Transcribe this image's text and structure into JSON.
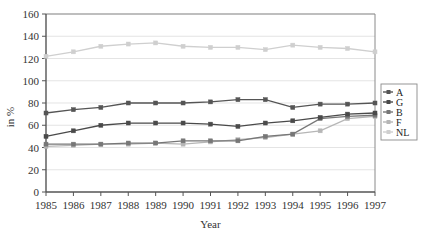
{
  "chart_data": {
    "type": "line",
    "title": "",
    "xlabel": "Year",
    "ylabel": "in %",
    "x": [
      1985,
      1986,
      1987,
      1988,
      1989,
      1990,
      1991,
      1992,
      1993,
      1994,
      1995,
      1996,
      1997
    ],
    "categories": [
      "1985",
      "1986",
      "1987",
      "1988",
      "1989",
      "1990",
      "1991",
      "1992",
      "1993",
      "1994",
      "1995",
      "1996",
      "1997"
    ],
    "ylim": [
      0,
      160
    ],
    "yticks": [
      0,
      20,
      40,
      60,
      80,
      100,
      120,
      140,
      160
    ],
    "ytick_labels": [
      "0",
      "20",
      "40",
      "60",
      "80",
      "100",
      "120",
      "140",
      "160"
    ],
    "grid": true,
    "legend_position": "right",
    "series": [
      {
        "name": "A",
        "color": "#555555",
        "values": [
          71,
          74,
          76,
          80,
          80,
          80,
          81,
          83,
          83,
          76,
          79,
          79,
          80
        ]
      },
      {
        "name": "G",
        "color": "#4a4a4a",
        "values": [
          50,
          55,
          60,
          62,
          62,
          62,
          61,
          59,
          62,
          64,
          67,
          70,
          71
        ]
      },
      {
        "name": "B",
        "color": "#777777",
        "values": [
          43,
          43,
          43,
          44,
          44,
          46,
          46,
          46,
          50,
          52,
          66,
          68,
          69
        ]
      },
      {
        "name": "F",
        "color": "#b6b6b6",
        "values": [
          41,
          42,
          43,
          43,
          44,
          43,
          45,
          47,
          49,
          52,
          55,
          66,
          68
        ]
      },
      {
        "name": "NL",
        "color": "#cfcfcf",
        "values": [
          122,
          126,
          131,
          133,
          134,
          131,
          130,
          130,
          128,
          132,
          130,
          129,
          126
        ]
      }
    ]
  }
}
